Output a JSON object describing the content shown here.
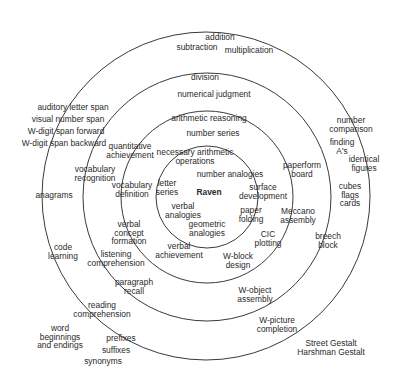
{
  "diagram": {
    "type": "radex",
    "center_label": "Raven",
    "rings": [
      {
        "name": "ring-1",
        "r": 51
      },
      {
        "name": "ring-2",
        "r": 86
      },
      {
        "name": "ring-3",
        "r": 124
      },
      {
        "name": "ring-4",
        "r": 164
      }
    ],
    "labels": [
      {
        "id": "raven",
        "lines": [
          "Raven"
        ],
        "x": 209,
        "y": 192,
        "bold": true
      },
      {
        "id": "letter-series",
        "lines": [
          "letter",
          "series"
        ],
        "x": 167,
        "y": 188
      },
      {
        "id": "number-analogies",
        "lines": [
          "number analogies"
        ],
        "x": 230,
        "y": 174
      },
      {
        "id": "necessary-arithmetic-operations",
        "lines": [
          "necessary arithmetic",
          "operations"
        ],
        "x": 195,
        "y": 157
      },
      {
        "id": "verbal-analogies",
        "lines": [
          "verbal",
          "analogies"
        ],
        "x": 183,
        "y": 211
      },
      {
        "id": "geometric-analogies",
        "lines": [
          "geometric",
          "analogies"
        ],
        "x": 207,
        "y": 229
      },
      {
        "id": "surface-development",
        "lines": [
          "surface",
          "development"
        ],
        "x": 263,
        "y": 192
      },
      {
        "id": "paper-folding",
        "lines": [
          "paper",
          "folding"
        ],
        "x": 251,
        "y": 215
      },
      {
        "id": "number-series",
        "lines": [
          "number series"
        ],
        "x": 213,
        "y": 133
      },
      {
        "id": "arithmetic-reasoning",
        "lines": [
          "arithmetic reasoning"
        ],
        "x": 209,
        "y": 118
      },
      {
        "id": "quantitative-achievement",
        "lines": [
          "quantitative",
          "achievement"
        ],
        "x": 130,
        "y": 151
      },
      {
        "id": "vocabulary-definition",
        "lines": [
          "vocabulary",
          "definition"
        ],
        "x": 132,
        "y": 190
      },
      {
        "id": "verbal-concept-formation",
        "lines": [
          "verbal",
          "concept",
          "formation"
        ],
        "x": 129,
        "y": 233
      },
      {
        "id": "verbal-achievement",
        "lines": [
          "verbal",
          "achievement"
        ],
        "x": 179,
        "y": 251
      },
      {
        "id": "w-block-design",
        "lines": [
          "W-block",
          "design"
        ],
        "x": 238,
        "y": 261
      },
      {
        "id": "cic-plotting",
        "lines": [
          "CIC",
          "plotting"
        ],
        "x": 268,
        "y": 239
      },
      {
        "id": "paperform-board",
        "lines": [
          "paperform",
          "board"
        ],
        "x": 302,
        "y": 170
      },
      {
        "id": "meccano-assembly",
        "lines": [
          "Meccano",
          "assembly"
        ],
        "x": 298,
        "y": 216
      },
      {
        "id": "numerical-judgment",
        "lines": [
          "numerical judgment"
        ],
        "x": 214,
        "y": 94
      },
      {
        "id": "division",
        "lines": [
          "division"
        ],
        "x": 205,
        "y": 77
      },
      {
        "id": "vocabulary-recognition",
        "lines": [
          "vocabulary",
          "recognition"
        ],
        "x": 95,
        "y": 174
      },
      {
        "id": "listening-comprehension",
        "lines": [
          "listening",
          "comprehension"
        ],
        "x": 116,
        "y": 259
      },
      {
        "id": "paragraph-recall",
        "lines": [
          "paragraph",
          "recall"
        ],
        "x": 134,
        "y": 287
      },
      {
        "id": "w-object-assembly",
        "lines": [
          "W-object",
          "assembly"
        ],
        "x": 255,
        "y": 295
      },
      {
        "id": "addition",
        "lines": [
          "addition"
        ],
        "x": 220,
        "y": 37
      },
      {
        "id": "subtraction",
        "lines": [
          "subtraction"
        ],
        "x": 197,
        "y": 47
      },
      {
        "id": "multiplication",
        "lines": [
          "multiplication"
        ],
        "x": 249,
        "y": 50
      },
      {
        "id": "auditory-letter-span",
        "lines": [
          "auditory letter span"
        ],
        "x": 73,
        "y": 107
      },
      {
        "id": "visual-number-span",
        "lines": [
          "visual number span"
        ],
        "x": 68,
        "y": 119
      },
      {
        "id": "w-digit-span-forward",
        "lines": [
          "W-digit span forward"
        ],
        "x": 66,
        "y": 131
      },
      {
        "id": "w-digit-span-backward",
        "lines": [
          "W-digit span backward"
        ],
        "x": 64,
        "y": 143
      },
      {
        "id": "anagrams",
        "lines": [
          "anagrams"
        ],
        "x": 54,
        "y": 195
      },
      {
        "id": "code-learning",
        "lines": [
          "code",
          "learning"
        ],
        "x": 63,
        "y": 252
      },
      {
        "id": "reading-comprehension",
        "lines": [
          "reading",
          "comprehension"
        ],
        "x": 102,
        "y": 310
      },
      {
        "id": "word-beginnings-and-endings",
        "lines": [
          "word",
          "beginnings",
          "and endings"
        ],
        "x": 60,
        "y": 337
      },
      {
        "id": "prefixes",
        "lines": [
          "prefixes"
        ],
        "x": 121,
        "y": 338
      },
      {
        "id": "suffixes",
        "lines": [
          "suffixes"
        ],
        "x": 116,
        "y": 350
      },
      {
        "id": "synonyms",
        "lines": [
          "synonyms"
        ],
        "x": 103,
        "y": 361
      },
      {
        "id": "number-comparison",
        "lines": [
          "number",
          "comparison"
        ],
        "x": 351,
        "y": 125
      },
      {
        "id": "finding-as",
        "lines": [
          "finding",
          "A's"
        ],
        "x": 342,
        "y": 147
      },
      {
        "id": "identical-figures",
        "lines": [
          "identical",
          "figures"
        ],
        "x": 364,
        "y": 164
      },
      {
        "id": "cubes-flags-cards",
        "lines": [
          "cubes",
          "flags",
          "cards"
        ],
        "x": 350,
        "y": 195
      },
      {
        "id": "breech-block",
        "lines": [
          "breech",
          "block"
        ],
        "x": 328,
        "y": 241
      },
      {
        "id": "w-picture-completion",
        "lines": [
          "W-picture",
          "completion"
        ],
        "x": 277,
        "y": 325
      },
      {
        "id": "street-harshman-gestalt",
        "lines": [
          "Street Gestalt",
          "Harshman Gestalt"
        ],
        "x": 331,
        "y": 348
      }
    ]
  }
}
